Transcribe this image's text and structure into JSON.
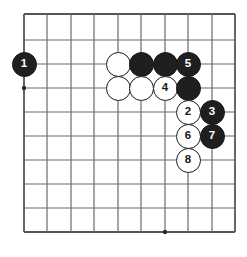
{
  "figure": {
    "kind": "go-board-diagram",
    "title": "",
    "width": 247,
    "height": 257,
    "background_color": "#ffffff"
  },
  "board": {
    "columns": 10,
    "rows": 10,
    "line_color": "#6d6b6b",
    "edge_line_color": "#575555",
    "line_width": 1.2,
    "edge_line_width": 1.8,
    "origin_x": 24,
    "origin_y": 14,
    "spacing_x": 23.45,
    "spacing_y": 24.2,
    "vertical_line_x": [
      24,
      47,
      71,
      94,
      118,
      141,
      165,
      188,
      212,
      235
    ],
    "horizontal_line_y": [
      14,
      40,
      64,
      88,
      112,
      136,
      160,
      184,
      208,
      232
    ],
    "star_points": [
      {
        "col": 0,
        "row": 3
      },
      {
        "col": 6,
        "row": 9
      }
    ],
    "star_point_radius": 2.2,
    "star_point_color": "#2b2929"
  },
  "stones": [
    {
      "id": "stone-b1",
      "color": "black",
      "label": "1",
      "col": 0,
      "row": 2
    },
    {
      "id": "stone-w-a",
      "color": "white",
      "label": "",
      "col": 4,
      "row": 2
    },
    {
      "id": "stone-b-a",
      "color": "black",
      "label": "",
      "col": 5,
      "row": 2
    },
    {
      "id": "stone-b-b",
      "color": "black",
      "label": "",
      "col": 6,
      "row": 2
    },
    {
      "id": "stone-b5",
      "color": "black",
      "label": "5",
      "col": 7,
      "row": 2
    },
    {
      "id": "stone-w-b",
      "color": "white",
      "label": "",
      "col": 4,
      "row": 3
    },
    {
      "id": "stone-w-c",
      "color": "white",
      "label": "",
      "col": 5,
      "row": 3
    },
    {
      "id": "stone-w4",
      "color": "white",
      "label": "4",
      "col": 6,
      "row": 3
    },
    {
      "id": "stone-b-c",
      "color": "black",
      "label": "",
      "col": 7,
      "row": 3
    },
    {
      "id": "stone-w2",
      "color": "white",
      "label": "2",
      "col": 7,
      "row": 4
    },
    {
      "id": "stone-b3",
      "color": "black",
      "label": "3",
      "col": 8,
      "row": 4
    },
    {
      "id": "stone-w6",
      "color": "white",
      "label": "6",
      "col": 7,
      "row": 5
    },
    {
      "id": "stone-b7",
      "color": "black",
      "label": "7",
      "col": 8,
      "row": 5
    },
    {
      "id": "stone-w8",
      "color": "white",
      "label": "8",
      "col": 7,
      "row": 6
    }
  ],
  "colors": {
    "black_stone": "#201e1e",
    "white_stone": "#ffffff",
    "stone_outline": "#1d1b1b",
    "black_label": "#ffffff",
    "white_label": "#1a1818"
  }
}
